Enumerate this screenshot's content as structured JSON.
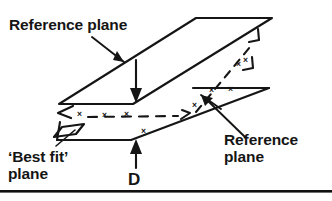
{
  "figure": {
    "width": 332,
    "height": 201,
    "background_color": "#ffffff",
    "ink_color": "#151515"
  },
  "labels": {
    "reference_plane_top": "Reference plane",
    "reference_plane_right": "Reference\nplane",
    "best_fit_plane": "‘Best fit’\nplane",
    "dimension_d": "D"
  },
  "annotations": {
    "measurement_mark": "×",
    "measurement_mark_count": 9,
    "dimension_symbol": "D",
    "dimension_meaning": "separation between reference planes"
  },
  "geometry": {
    "upper_plane": {
      "name": "upper reference plane",
      "style": "solid",
      "corners": [
        [
          196,
          18
        ],
        [
          272,
          18
        ],
        [
          133,
          104
        ],
        [
          59,
          104
        ]
      ]
    },
    "lower_plane": {
      "name": "lower reference plane",
      "style": "solid",
      "corners": [
        [
          193,
          88
        ],
        [
          269,
          88
        ],
        [
          131,
          140
        ],
        [
          57,
          140
        ]
      ]
    },
    "best_fit_plane": {
      "name": "best fit plane",
      "style": "dashed",
      "note": "dashed mid-plane through scattered measurement points"
    },
    "tab": {
      "name": "best fit plane corner tab",
      "style": "solid"
    }
  },
  "marks": [
    {
      "x": 77,
      "y": 110
    },
    {
      "x": 102,
      "y": 111
    },
    {
      "x": 124,
      "y": 110
    },
    {
      "x": 141,
      "y": 127
    },
    {
      "x": 192,
      "y": 101
    },
    {
      "x": 209,
      "y": 86
    },
    {
      "x": 228,
      "y": 85
    },
    {
      "x": 236,
      "y": 60
    },
    {
      "x": 243,
      "y": 56
    }
  ],
  "colors": {
    "ink": "#151515",
    "background": "#ffffff",
    "rule": "#111111"
  }
}
